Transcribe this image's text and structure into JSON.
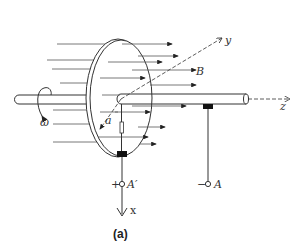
{
  "figure": {
    "caption": "(a)"
  },
  "labels": {
    "omega": "ω",
    "radius": "a",
    "field": "B",
    "axis_y": "y",
    "axis_z": "z",
    "axis_x": "x",
    "terminal_positive_sign": "+",
    "terminal_positive": "A′",
    "terminal_negative_sign": "−",
    "terminal_negative": "A"
  },
  "colors": {
    "line": "#333333",
    "field_line": "#555555",
    "brush": "#111111",
    "background": "#ffffff"
  }
}
